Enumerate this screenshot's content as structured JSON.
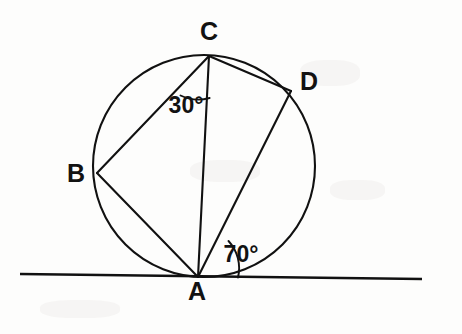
{
  "figure": {
    "background_color": "#fdfdfc",
    "ink_color": "#111111",
    "canvas": {
      "width": 462,
      "height": 334
    }
  },
  "circle": {
    "name": "circumscribed-circle",
    "center_x": 204,
    "center_y": 166,
    "radius": 111
  },
  "points": [
    {
      "id": "A",
      "label": "A",
      "x": 198,
      "y": 277,
      "label_x": 197,
      "label_y": 300
    },
    {
      "id": "B",
      "label": "B",
      "x": 97,
      "y": 173,
      "label_x": 76,
      "label_y": 182
    },
    {
      "id": "C",
      "label": "C",
      "x": 209,
      "y": 56,
      "label_x": 209,
      "label_y": 40
    },
    {
      "id": "D",
      "label": "D",
      "x": 291,
      "y": 91,
      "label_x": 309,
      "label_y": 90
    }
  ],
  "chords": [
    {
      "id": "CB",
      "from": "C",
      "to": "B"
    },
    {
      "id": "CA",
      "from": "C",
      "to": "A"
    },
    {
      "id": "CD",
      "from": "C",
      "to": "D"
    },
    {
      "id": "BA",
      "from": "B",
      "to": "A"
    },
    {
      "id": "DA",
      "from": "D",
      "to": "A"
    }
  ],
  "tangent_line": {
    "name": "tangent-at-A",
    "x1": 20,
    "y1": 274,
    "x2": 422,
    "y2": 279
  },
  "angles": [
    {
      "id": "angle-BCA",
      "value": "30°",
      "vertex": "C",
      "between": [
        "B",
        "A"
      ],
      "label_x": 186,
      "label_y": 113,
      "arc": "M 180.5 95.5 A 42 42 0 0 0 209.6 98.0"
    },
    {
      "id": "angle-DAT",
      "value": "70°",
      "vertex": "A",
      "between": [
        "D",
        "tangent-right"
      ],
      "label_x": 241,
      "label_y": 262,
      "arc": "M 228.5 241.0 A 40 40 0 0 1 238.0 277.5"
    }
  ],
  "paths": {
    "chord_CB": "M 209 56 L 97 173",
    "chord_CA": "M 209 56 L 198 277",
    "chord_CD": "M 209 56 L 291 91",
    "chord_BA": "M 97 173 L 198 277",
    "chord_DA": "M 291 91 L 198 277"
  }
}
